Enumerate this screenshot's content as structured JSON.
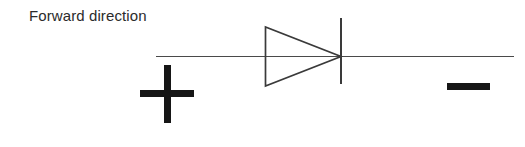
{
  "figure": {
    "kind": "circuit-diagram",
    "component": "semiconductor-diode",
    "background_color": "#ffffff",
    "stroke_color": "#3a3a3a",
    "symbol_color": "#161616",
    "text_color": "#2b2b2b",
    "width": 525,
    "height": 147
  },
  "labels": {
    "forward_direction": "Forward direction",
    "plus_sign": "+",
    "minus_sign": "−"
  },
  "geometry": {
    "lead_line": {
      "x1": 156,
      "y1": 56.5,
      "x2": 514,
      "y2": 56.5,
      "stroke_width": 1.4
    },
    "triangle": {
      "apex_x": 341,
      "apex_y": 56.5,
      "back_x": 265,
      "top_y": 27,
      "bottom_y": 86,
      "stroke_width": 1.6
    },
    "cathode_bar": {
      "x": 341,
      "y1": 18,
      "y2": 84,
      "stroke_width": 1.8
    },
    "plus": {
      "horizontal": {
        "x": 140,
        "y": 90,
        "w": 54,
        "h": 7
      },
      "vertical": {
        "x": 164,
        "y": 65,
        "w": 7,
        "h": 58
      }
    },
    "minus": {
      "x": 447,
      "y": 83,
      "w": 43,
      "h": 7
    }
  }
}
